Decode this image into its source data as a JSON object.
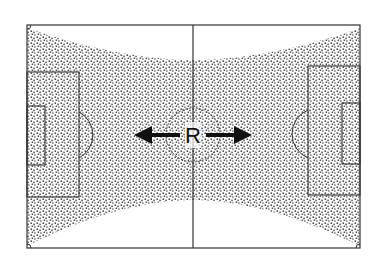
{
  "diagram": {
    "type": "football-pitch-coverage",
    "center_label": "R",
    "arrows": [
      "left",
      "right"
    ],
    "colors": {
      "lines": "#333333",
      "stipple": "#222222",
      "background": "#ffffff"
    },
    "shaded_region": "bow-tie area covering both ends of the pitch, narrowing toward the halfway line, with white zones at the top-center and bottom-center"
  }
}
